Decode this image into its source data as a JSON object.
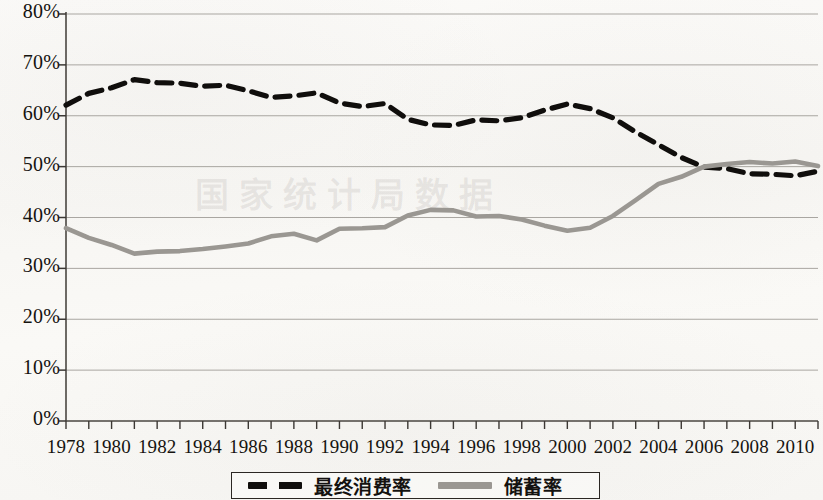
{
  "chart_data": {
    "type": "line",
    "title": "",
    "subtitle": "",
    "xlabel": "",
    "ylabel": "",
    "xlim": [
      1978,
      2011
    ],
    "ylim": [
      0,
      80
    ],
    "y_tick_labels": [
      "80%",
      "70%",
      "60%",
      "50%",
      "40%",
      "30%",
      "20%",
      "10%",
      "0%"
    ],
    "y_tick_values": [
      80,
      70,
      60,
      50,
      40,
      30,
      20,
      10,
      0
    ],
    "grid": "horizontal",
    "legend_position": "bottom",
    "x": [
      1978,
      1979,
      1980,
      1981,
      1982,
      1983,
      1984,
      1985,
      1986,
      1987,
      1988,
      1989,
      1990,
      1991,
      1992,
      1993,
      1994,
      1995,
      1996,
      1997,
      1998,
      1999,
      2000,
      2001,
      2002,
      2003,
      2004,
      2005,
      2006,
      2007,
      2008,
      2009,
      2010,
      2011
    ],
    "x_tick_labels": [
      "1978",
      "1980",
      "1982",
      "1984",
      "1986",
      "1988",
      "1990",
      "1992",
      "1994",
      "1996",
      "1998",
      "2000",
      "2002",
      "2004",
      "2006",
      "2008",
      "2010"
    ],
    "x_tick_values": [
      1978,
      1980,
      1982,
      1984,
      1986,
      1988,
      1990,
      1992,
      1994,
      1996,
      1998,
      2000,
      2002,
      2004,
      2006,
      2008,
      2010
    ],
    "series": [
      {
        "name": "最终消费率",
        "style": "dashed",
        "color": "#100e0c",
        "values": [
          62.1,
          64.4,
          65.5,
          67.1,
          66.5,
          66.4,
          65.8,
          66.0,
          64.9,
          63.6,
          63.9,
          64.5,
          62.5,
          61.8,
          62.4,
          59.3,
          58.2,
          58.1,
          59.2,
          59.0,
          59.6,
          61.1,
          62.3,
          61.4,
          59.6,
          56.8,
          54.3,
          51.8,
          49.9,
          49.6,
          48.6,
          48.5,
          48.2,
          49.1
        ],
        "unit": "%"
      },
      {
        "name": "储蓄率",
        "style": "solid",
        "color": "#9a9792",
        "values": [
          37.9,
          36.0,
          34.6,
          32.9,
          33.3,
          33.4,
          33.8,
          34.3,
          34.9,
          36.3,
          36.8,
          35.5,
          37.8,
          37.9,
          38.1,
          40.4,
          41.5,
          41.4,
          40.2,
          40.3,
          39.6,
          38.4,
          37.4,
          38.0,
          40.3,
          43.4,
          46.6,
          48.0,
          50.0,
          50.5,
          50.9,
          50.6,
          51.0,
          50.1
        ],
        "unit": "%"
      }
    ]
  },
  "legend": {
    "entries": [
      {
        "label": "最终消费率",
        "style": "dashed"
      },
      {
        "label": "储蓄率",
        "style": "solid"
      }
    ]
  },
  "watermark": {
    "text": "国家统计局数据"
  }
}
